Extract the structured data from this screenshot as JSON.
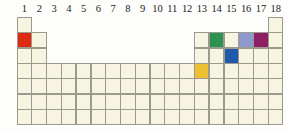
{
  "figure": {
    "type": "periodic-table-grid",
    "cell_background": "#f7f4e2",
    "cell_border": "#9a9a8e",
    "page_background": "#fdfdfb"
  },
  "header": {
    "label": "group-numbers",
    "groups": [
      "1",
      "2",
      "3",
      "4",
      "5",
      "6",
      "7",
      "8",
      "9",
      "10",
      "11",
      "12",
      "13",
      "14",
      "15",
      "16",
      "17",
      "18"
    ]
  },
  "grid": {
    "columns": 18,
    "rows": 7,
    "row_spans": [
      {
        "row": 1,
        "filled_groups": [
          1,
          18
        ]
      },
      {
        "row": 2,
        "filled_groups": [
          1,
          2,
          13,
          14,
          15,
          16,
          17,
          18
        ]
      },
      {
        "row": 3,
        "filled_groups": [
          1,
          2,
          13,
          14,
          15,
          16,
          17,
          18
        ]
      },
      {
        "row": 4,
        "filled_groups": [
          1,
          2,
          3,
          4,
          5,
          6,
          7,
          8,
          9,
          10,
          11,
          12,
          13,
          14,
          15,
          16,
          17,
          18
        ]
      },
      {
        "row": 5,
        "filled_groups": [
          1,
          2,
          3,
          4,
          5,
          6,
          7,
          8,
          9,
          10,
          11,
          12,
          13,
          14,
          15,
          16,
          17,
          18
        ]
      },
      {
        "row": 6,
        "filled_groups": [
          1,
          2,
          3,
          4,
          5,
          6,
          7,
          8,
          9,
          10,
          11,
          12,
          13,
          14,
          15,
          16,
          17,
          18
        ]
      },
      {
        "row": 7,
        "filled_groups": [
          1,
          2,
          3,
          4,
          5,
          6,
          7,
          8,
          9,
          10,
          11,
          12,
          13,
          14,
          15,
          16,
          17,
          18
        ]
      }
    ]
  },
  "highlighted_cells": [
    {
      "name": "highlight-group1-period2",
      "group": 1,
      "period": 2,
      "color": "#dc2a12"
    },
    {
      "name": "highlight-group14-period2",
      "group": 14,
      "period": 2,
      "color": "#2f9150"
    },
    {
      "name": "highlight-group16-period2",
      "group": 16,
      "period": 2,
      "color": "#8e9acb"
    },
    {
      "name": "highlight-group17-period2",
      "group": 17,
      "period": 2,
      "color": "#8e1f62"
    },
    {
      "name": "highlight-group15-period3",
      "group": 15,
      "period": 3,
      "color": "#1f5ba8"
    },
    {
      "name": "highlight-group13-period4",
      "group": 13,
      "period": 4,
      "color": "#edc032"
    }
  ]
}
